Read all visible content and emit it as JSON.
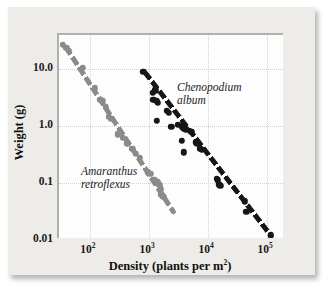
{
  "chart_data": {
    "type": "scatter",
    "title": "",
    "xlabel": "Density (plants per m2)",
    "xlabel_base": "Density (plants per m",
    "xlabel_sup": "2",
    "xlabel_tail": ")",
    "ylabel": "Weight (g)",
    "xscale": "log",
    "yscale": "log",
    "xlim": [
      30,
      200000
    ],
    "ylim": [
      0.01,
      40
    ],
    "grid": true,
    "legend_position": "inline-annotations",
    "xticks": [
      {
        "value": 100,
        "label": "10",
        "exponent": "2"
      },
      {
        "value": 1000,
        "label": "10",
        "exponent": "3"
      },
      {
        "value": 10000,
        "label": "10",
        "exponent": "4"
      },
      {
        "value": 100000,
        "label": "10",
        "exponent": "5"
      }
    ],
    "yticks": [
      {
        "value": 10,
        "label": "10.0"
      },
      {
        "value": 1,
        "label": "1.0"
      },
      {
        "value": 0.1,
        "label": "0.1"
      },
      {
        "value": 0.01,
        "label": "0.01"
      }
    ],
    "series": [
      {
        "name": "Amaranthus retroflexus",
        "label_line1": "Amaranthus",
        "label_line2": "retroflexus",
        "color": "#8b8b89",
        "marker": "circle",
        "trendline": {
          "style": "dashed",
          "x0": 36,
          "y0": 26.0,
          "x1": 2500,
          "y1": 0.031
        },
        "points": [
          [
            35,
            27.0
          ],
          [
            40,
            24.0
          ],
          [
            44,
            21.0
          ],
          [
            75,
            10.5
          ],
          [
            120,
            4.6
          ],
          [
            150,
            2.9
          ],
          [
            165,
            2.8
          ],
          [
            185,
            2.2
          ],
          [
            210,
            1.45
          ],
          [
            230,
            1.35
          ],
          [
            300,
            0.72
          ],
          [
            360,
            0.62
          ],
          [
            430,
            0.5
          ],
          [
            520,
            0.4
          ],
          [
            600,
            0.33
          ],
          [
            700,
            0.28
          ],
          [
            950,
            0.155
          ],
          [
            1050,
            0.145
          ],
          [
            1250,
            0.115
          ],
          [
            1400,
            0.105
          ],
          [
            1500,
            0.093
          ],
          [
            1600,
            0.078
          ],
          [
            1620,
            0.062
          ],
          [
            1700,
            0.06
          ],
          [
            1750,
            0.057
          ]
        ]
      },
      {
        "name": "Chenopodium album",
        "label_line1": "Chenopodium",
        "label_line2": "album",
        "color": "#15161a",
        "marker": "circle",
        "trendline": {
          "style": "dashed",
          "x0": 800,
          "y0": 9.2,
          "x1": 115000,
          "y1": 0.0115
        },
        "points": [
          [
            800,
            9.0
          ],
          [
            1150,
            3.9
          ],
          [
            1280,
            4.3
          ],
          [
            1180,
            2.9
          ],
          [
            1330,
            2.8
          ],
          [
            1400,
            2.55
          ],
          [
            1350,
            1.25
          ],
          [
            2000,
            1.85
          ],
          [
            2150,
            1.7
          ],
          [
            2400,
            0.98
          ],
          [
            3100,
            1.05
          ],
          [
            3600,
            1.0
          ],
          [
            3750,
            0.95
          ],
          [
            3900,
            0.92
          ],
          [
            4100,
            0.9
          ],
          [
            4300,
            0.86
          ],
          [
            3550,
            0.56
          ],
          [
            3900,
            0.35
          ],
          [
            5200,
            0.8
          ],
          [
            6200,
            0.52
          ],
          [
            6600,
            0.5
          ],
          [
            7400,
            0.4
          ],
          [
            7900,
            0.38
          ],
          [
            14000,
            0.118
          ],
          [
            14500,
            0.112
          ],
          [
            15500,
            0.093
          ],
          [
            16000,
            0.09
          ],
          [
            42000,
            0.048
          ],
          [
            44000,
            0.031
          ],
          [
            115000,
            0.012
          ]
        ]
      }
    ]
  }
}
